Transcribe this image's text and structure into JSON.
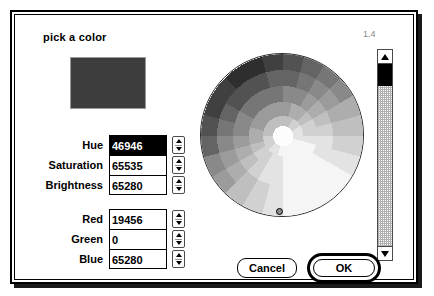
{
  "dialog": {
    "title": "pick a color",
    "gamma_label": "1.4",
    "swatch_color": "#3d3d3d"
  },
  "hsb": {
    "rows": [
      {
        "label": "Hue",
        "value": "46946",
        "selected": true
      },
      {
        "label": "Saturation",
        "value": "65535",
        "selected": false
      },
      {
        "label": "Brightness",
        "value": "65280",
        "selected": false
      }
    ]
  },
  "rgb": {
    "rows": [
      {
        "label": "Red",
        "value": "19456",
        "selected": false
      },
      {
        "label": "Green",
        "value": "0",
        "selected": false
      },
      {
        "label": "Blue",
        "value": "65280",
        "selected": false
      }
    ]
  },
  "buttons": {
    "cancel": "Cancel",
    "ok": "OK"
  },
  "icons": {
    "stepper_up": "stepper-up-arrow-icon",
    "stepper_down": "stepper-down-arrow-icon",
    "scroll_up": "scroll-up-arrow-icon",
    "scroll_down": "scroll-down-arrow-icon"
  }
}
